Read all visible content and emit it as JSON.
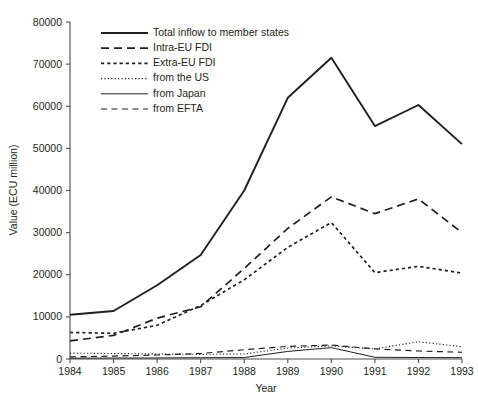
{
  "chart_data": {
    "type": "line",
    "title": "",
    "xlabel": "Year",
    "ylabel": "Value (ECU million)",
    "x": [
      1984,
      1985,
      1986,
      1987,
      1988,
      1989,
      1990,
      1991,
      1992,
      1993
    ],
    "categories": [
      "1984",
      "1985",
      "1986",
      "1987",
      "1988",
      "1989",
      "1990",
      "1991",
      "1992",
      "1993"
    ],
    "xlim": [
      1984,
      1993
    ],
    "ylim": [
      0,
      80000
    ],
    "ytick_labels": [
      "0",
      "10000",
      "20000",
      "30000",
      "40000",
      "50000",
      "60000",
      "70000",
      "80000"
    ],
    "ytick_values": [
      0,
      10000,
      20000,
      30000,
      40000,
      50000,
      60000,
      70000,
      80000
    ],
    "grid": false,
    "legend_position": "upper-left-inside",
    "series": [
      {
        "name": "Total inflow to member states",
        "style": "solid-thick",
        "values": [
          10500,
          11400,
          17500,
          24700,
          40000,
          62000,
          71500,
          55300,
          60300,
          51000
        ]
      },
      {
        "name": "Intra-EU FDI",
        "style": "long-dash",
        "values": [
          4300,
          5600,
          9700,
          12400,
          21500,
          31000,
          38500,
          34500,
          38000,
          30000
        ]
      },
      {
        "name": "Extra-EU FDI",
        "style": "short-dash",
        "values": [
          6300,
          6100,
          8000,
          12700,
          18800,
          26500,
          32400,
          20500,
          22000,
          20400
        ]
      },
      {
        "name": "from the US",
        "style": "fine-dot",
        "values": [
          1400,
          1300,
          1200,
          1100,
          1200,
          2600,
          3100,
          2400,
          4100,
          2900
        ]
      },
      {
        "name": "from Japan",
        "style": "thin-solid",
        "values": [
          200,
          220,
          250,
          300,
          350,
          1800,
          2700,
          400,
          350,
          330
        ]
      },
      {
        "name": "from EFTA",
        "style": "medium-dash",
        "values": [
          500,
          700,
          950,
          1300,
          2200,
          3000,
          3300,
          2400,
          1900,
          1600
        ]
      }
    ]
  },
  "legend": {
    "items": [
      {
        "label": "Total inflow to member states",
        "style": "solid-thick"
      },
      {
        "label": "Intra-EU FDI",
        "style": "long-dash"
      },
      {
        "label": "Extra-EU FDI",
        "style": "short-dash"
      },
      {
        "label": "from the US",
        "style": "fine-dot"
      },
      {
        "label": "from Japan",
        "style": "thin-solid"
      },
      {
        "label": "from EFTA",
        "style": "medium-dash"
      }
    ]
  },
  "colors": {
    "line": "#231f20",
    "axis": "#4d4d4f",
    "background": "#ffffff"
  }
}
